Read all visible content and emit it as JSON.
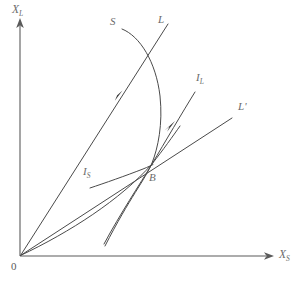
{
  "figure": {
    "type": "diagram",
    "title": "",
    "background_color": "#ffffff",
    "line_color": "#4a4a4a",
    "axis_color": "#5a5a5a",
    "label_color": "#6b6b6b",
    "width": 300,
    "height": 289
  },
  "axes": {
    "y": {
      "name": "X",
      "subscript": "L",
      "label": "X",
      "sub": "L"
    },
    "x": {
      "name": "X",
      "subscript": "S",
      "label": "X",
      "sub": "S"
    },
    "origin": {
      "label": "0"
    }
  },
  "curves": [
    {
      "id": "S",
      "label": "S",
      "sub": "",
      "description": "S schedule, bows rightward from upper left down to equilibrium point B and continues to lower tail"
    },
    {
      "id": "L",
      "label": "L",
      "sub": "",
      "description": "L schedule, steep ray from origin through B region up to upper right"
    },
    {
      "id": "I_L",
      "label": "I",
      "sub": "L",
      "description": "I sub L trajectory, steep rising path through B toward upper right"
    },
    {
      "id": "I_S",
      "label": "I",
      "sub": "S",
      "description": "I sub S trajectory, shallow curve entering B from the left"
    },
    {
      "id": "L_prime",
      "label": "L",
      "sub": "",
      "prime": "'",
      "description": "L prime schedule, shallow ray from origin through B to upper right"
    }
  ],
  "points": [
    {
      "id": "B",
      "label": "B",
      "description": "Saddle-point equilibrium where all schedules intersect"
    }
  ],
  "arrows": [
    {
      "id": "arrow-on-L",
      "direction": "up-right",
      "description": "Motion arrow on the steep L ray"
    },
    {
      "id": "arrow-on-IL",
      "direction": "up-right",
      "description": "Motion arrow on the I sub L stable arm toward B"
    }
  ]
}
